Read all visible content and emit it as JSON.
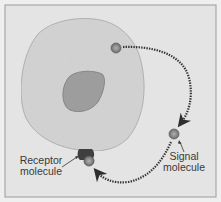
{
  "diagram": {
    "type": "autocrine-signaling",
    "labels": {
      "receptor_line1": "Receptor",
      "receptor_line2": "molecule",
      "signal_line1": "Signal",
      "signal_line2": "molecule"
    },
    "elements": {
      "cell": "cell-body",
      "nucleus": "nucleus",
      "signal_molecules": 3,
      "receptor": "receptor-molecule"
    },
    "colors": {
      "background": "#e6e6e6",
      "frame": "#a8a8a8",
      "cell_fill": "#d4d4d4",
      "nucleus_fill": "#9a9a9a",
      "molecule": "#8a8a8a",
      "receptor": "#3f3f3f",
      "arrow": "#333333"
    }
  }
}
